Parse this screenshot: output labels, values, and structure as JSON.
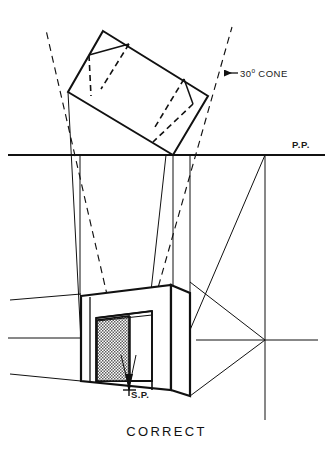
{
  "figure": {
    "caption": "CORRECT",
    "width": 333,
    "height": 468,
    "background": "#ffffff",
    "ink_color": "#111111",
    "labels": {
      "picture_plane": "P.P.",
      "station_point": "S.P.",
      "cone_value": "30",
      "cone_degree_symbol": "o",
      "cone_word": "CONE",
      "cone_full": "30° CONE"
    }
  },
  "diagram_data": {
    "type": "technical-perspective-construction-drawing",
    "subject": "Two-point perspective layout: plan view above picture plane, perspective view below, with 30-degree cone of vision check",
    "views": [
      {
        "name": "plan-view",
        "description": "Rotated rectangular plan of the building, touching the picture plane at its near corner",
        "corners": [
          {
            "label": "top",
            "x": 103,
            "y": 31
          },
          {
            "label": "right",
            "x": 208,
            "y": 96
          },
          {
            "label": "bottom-on-pp",
            "x": 173,
            "y": 155
          },
          {
            "label": "left",
            "x": 68,
            "y": 92
          }
        ],
        "interior_divisions": "dashed lines indicating recess and wall thickness"
      },
      {
        "name": "perspective-view",
        "description": "Resulting two-point perspective of the building with recessed opening and stippled side wall",
        "vanishing_points": [
          {
            "label": "right-vanishing-point",
            "x": 265,
            "y": 340
          },
          {
            "label": "left-vanishing-point",
            "x": -260,
            "y": 340,
            "note": "off-sheet to the left"
          }
        ]
      }
    ],
    "picture_plane": {
      "label": "P.P.",
      "y": 155,
      "x_start": 8,
      "x_end": 325,
      "note": "horizontal heavy line marking the picture plane in plan"
    },
    "horizon_line": {
      "y": 340,
      "note": "eye-level line through the right vanishing point in the perspective view"
    },
    "station_point": {
      "label": "S.P.",
      "x": 129,
      "y": 390,
      "marker": "cross",
      "note": "apex of the cone of vision; all visual rays converge here"
    },
    "cone_of_vision": {
      "label": "30° CONE",
      "angle_degrees": 30,
      "line_style": "dashed",
      "apex": {
        "x": 129,
        "y": 390
      },
      "left_ray_top": {
        "x": 46,
        "y": 30
      },
      "right_ray_top": {
        "x": 232,
        "y": 27
      },
      "annotation_arrow": "leftward arrow from the label to the right cone ray",
      "note": "the plan fits inside the 30-degree cone, therefore the setup is CORRECT"
    },
    "shading": {
      "stipple_fill": "fine checkered/dotted texture on the recessed side wall of the perspective view",
      "fill_color": "#6b6b6b"
    }
  }
}
